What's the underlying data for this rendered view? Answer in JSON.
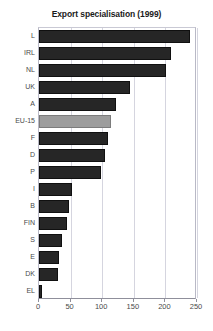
{
  "chart_data": {
    "type": "bar",
    "orientation": "horizontal",
    "title": "Export specialisation (1999)",
    "xlabel": "",
    "ylabel": "",
    "xlim": [
      0,
      250
    ],
    "ylim": null,
    "grid": true,
    "legend": null,
    "xticks": [
      "0",
      "50",
      "100",
      "150",
      "200",
      "250"
    ],
    "xtick_values": [
      0,
      50,
      100,
      150,
      200,
      250
    ],
    "categories": [
      "L",
      "IRL",
      "NL",
      "UK",
      "A",
      "EU-15",
      "F",
      "D",
      "P",
      "I",
      "B",
      "FIN",
      "S",
      "E",
      "DK",
      "EL"
    ],
    "values": [
      239,
      209,
      201,
      144,
      122,
      114,
      109,
      104,
      98,
      52,
      48,
      44,
      36,
      32,
      30,
      5
    ],
    "highlight_category": "EU-15",
    "colors": {
      "bar": "#262626",
      "bar_border": "#101010",
      "highlight_bar": "#9d9d9d",
      "highlight_bar_border": "#7c7c7c",
      "gridline": "#d5d5df",
      "axis": "#8f8f9b",
      "title_text": "#1b1b1b",
      "tick_text": "#4a4a4a",
      "background": "#ffffff"
    }
  }
}
